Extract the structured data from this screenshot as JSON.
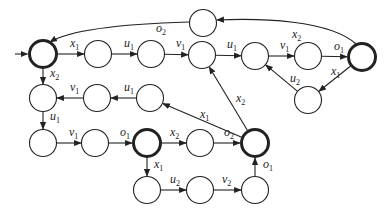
{
  "diagram": {
    "type": "state-transition-graph",
    "colors": {
      "stroke": "#222222",
      "background": "#ffffff"
    },
    "nodes": [
      {
        "id": "s0",
        "x": 43,
        "y": 54,
        "accepting": true,
        "initial": true
      },
      {
        "id": "s1",
        "x": 98,
        "y": 54
      },
      {
        "id": "s2",
        "x": 151,
        "y": 54
      },
      {
        "id": "s3",
        "x": 202,
        "y": 55
      },
      {
        "id": "s4",
        "x": 255,
        "y": 56
      },
      {
        "id": "s5",
        "x": 308,
        "y": 56
      },
      {
        "id": "s6",
        "x": 362,
        "y": 57,
        "accepting": true
      },
      {
        "id": "s7",
        "x": 203,
        "y": 23
      },
      {
        "id": "s8",
        "x": 308,
        "y": 100
      },
      {
        "id": "s9",
        "x": 43,
        "y": 98
      },
      {
        "id": "s10",
        "x": 97,
        "y": 98
      },
      {
        "id": "s11",
        "x": 150,
        "y": 98
      },
      {
        "id": "s12",
        "x": 43,
        "y": 143
      },
      {
        "id": "s13",
        "x": 95,
        "y": 143
      },
      {
        "id": "s14",
        "x": 147,
        "y": 143,
        "accepting": true
      },
      {
        "id": "s15",
        "x": 200,
        "y": 143
      },
      {
        "id": "s16",
        "x": 255,
        "y": 143,
        "accepting": true
      },
      {
        "id": "s17",
        "x": 147,
        "y": 190
      },
      {
        "id": "s18",
        "x": 200,
        "y": 190
      },
      {
        "id": "s19",
        "x": 255,
        "y": 190
      }
    ],
    "edges": [
      {
        "from": "s0",
        "to": "s1",
        "label": "x",
        "sub": "1"
      },
      {
        "from": "s1",
        "to": "s2",
        "label": "u",
        "sub": "1"
      },
      {
        "from": "s2",
        "to": "s3",
        "label": "v",
        "sub": "1"
      },
      {
        "from": "s3",
        "to": "s4",
        "label": "u",
        "sub": "1"
      },
      {
        "from": "s4",
        "to": "s5",
        "label": "v",
        "sub": "1"
      },
      {
        "from": "s5",
        "to": "s6",
        "label": "o",
        "sub": "1"
      },
      {
        "from": "s6",
        "to": "s7",
        "label": "x",
        "sub": "2"
      },
      {
        "from": "s7",
        "to": "s0",
        "label": "o",
        "sub": "2"
      },
      {
        "from": "s6",
        "to": "s8",
        "label": "x",
        "sub": "1"
      },
      {
        "from": "s8",
        "to": "s4",
        "label": "u",
        "sub": "2"
      },
      {
        "from": "s0",
        "to": "s9",
        "label": "x",
        "sub": "2"
      },
      {
        "from": "s11",
        "to": "s10",
        "label": "u",
        "sub": "1"
      },
      {
        "from": "s10",
        "to": "s9",
        "label": "v",
        "sub": "1"
      },
      {
        "from": "s9",
        "to": "s12",
        "label": "u",
        "sub": "1"
      },
      {
        "from": "s12",
        "to": "s13",
        "label": "v",
        "sub": "1"
      },
      {
        "from": "s13",
        "to": "s14",
        "label": "o",
        "sub": "1"
      },
      {
        "from": "s14",
        "to": "s15",
        "label": "x",
        "sub": "2"
      },
      {
        "from": "s15",
        "to": "s16",
        "label": "o",
        "sub": "2"
      },
      {
        "from": "s14",
        "to": "s17",
        "label": "x",
        "sub": "1"
      },
      {
        "from": "s17",
        "to": "s18",
        "label": "u",
        "sub": "2"
      },
      {
        "from": "s18",
        "to": "s19",
        "label": "v",
        "sub": "2"
      },
      {
        "from": "s19",
        "to": "s16",
        "label": "o",
        "sub": "1"
      },
      {
        "from": "s16",
        "to": "s11",
        "label": "x",
        "sub": "1"
      },
      {
        "from": "s16",
        "to": "s3",
        "label": "x",
        "sub": "2"
      }
    ]
  }
}
